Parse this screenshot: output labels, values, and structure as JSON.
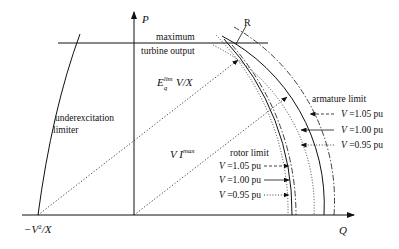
{
  "axes": {
    "p_label": "P",
    "q_label": "Q",
    "neg_label_prefix": "−V",
    "neg_label_sup": "2",
    "neg_label_suffix": "/X"
  },
  "labels": {
    "turbine_line1": "maximum",
    "turbine_line2": "turbine output",
    "point_r": "R",
    "underexcitation_line1": "underexcitation",
    "underexcitation_line2": "limiter",
    "eq_main": "E",
    "eq_sup": "lim",
    "eq_sub": "q",
    "eq_rest": " V/X",
    "vi_main": "V I",
    "vi_sup": "max"
  },
  "armature_limit": {
    "title": "armature limit",
    "entries": [
      {
        "var": "V",
        "text": " =1.05 pu",
        "style": "dashed"
      },
      {
        "var": "V",
        "text": " =1.00 pu",
        "style": "solid"
      },
      {
        "var": "V",
        "text": " =0.95 pu",
        "style": "dotted"
      }
    ]
  },
  "rotor_limit": {
    "title": "rotor limit",
    "entries": [
      {
        "var": "V",
        "text": " =1.05 pu",
        "style": "dashed"
      },
      {
        "var": "V",
        "text": " =1.00 pu",
        "style": "solid"
      },
      {
        "var": "V",
        "text": " =0.95 pu",
        "style": "dotted"
      }
    ]
  }
}
